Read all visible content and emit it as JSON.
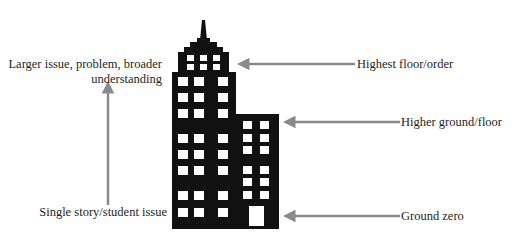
{
  "diagram": {
    "type": "building-metaphor",
    "left_labels": {
      "top_line1": "Larger issue, problem, broader",
      "top_line2": "understanding",
      "bottom": "Single story/student issue"
    },
    "right_labels": [
      {
        "id": "highest",
        "text": "Highest floor/order"
      },
      {
        "id": "higher",
        "text": "Higher ground/floor"
      },
      {
        "id": "ground",
        "text": "Ground zero"
      }
    ],
    "colors": {
      "building": "#111111",
      "window": "#ffffff",
      "arrow": "#8a8a8a",
      "text": "#1e1e1e",
      "background": "#ffffff"
    }
  }
}
